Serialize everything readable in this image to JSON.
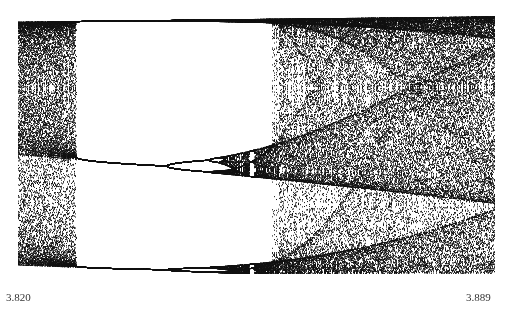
{
  "chart_data": {
    "type": "scatter",
    "title": "",
    "subtitle": "Logistic map bifurcation diagram (period-3 window)",
    "xlabel": "",
    "ylabel": "",
    "x_tick_labels": [
      "3.820",
      "3.889"
    ],
    "xlim": [
      3.82,
      3.889
    ],
    "ylim": [
      0.14,
      0.97
    ],
    "grid": false,
    "legend": null,
    "map": "x_{n+1} = r x_n (1 - x_n)",
    "iterations_discard": 400,
    "iterations_plot": 220,
    "point_color": "#111111",
    "annotations": [],
    "plot_box": {
      "left": 18,
      "top": 17,
      "right": 494,
      "bottom": 272
    }
  },
  "axis": {
    "xmin_label": "3.820",
    "xmax_label": "3.889"
  }
}
